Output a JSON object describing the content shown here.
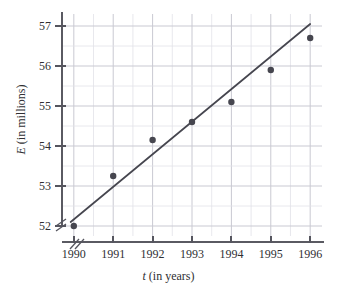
{
  "chart_data": {
    "type": "scatter",
    "title": "",
    "xlabel": "t (in years)",
    "xlabel_variable": "t",
    "xlabel_rest": " (in years)",
    "ylabel": "E (in millions)",
    "ylabel_variable": "E",
    "ylabel_rest": " (in millions)",
    "x": [
      1990,
      1991,
      1992,
      1993,
      1994,
      1995,
      1996
    ],
    "values": [
      52.0,
      53.25,
      54.15,
      54.6,
      55.1,
      55.9,
      56.7
    ],
    "series": [
      {
        "name": "E (in millions)",
        "values": [
          52.0,
          53.25,
          54.15,
          54.6,
          55.1,
          55.9,
          56.7
        ]
      }
    ],
    "xtick_labels": [
      "1990",
      "1991",
      "1992",
      "1993",
      "1994",
      "1995",
      "1996"
    ],
    "ytick_labels": [
      "52",
      "53",
      "54",
      "55",
      "56",
      "57"
    ],
    "ytick_values": [
      52,
      53,
      54,
      55,
      56,
      57
    ],
    "xlim": [
      1989.7,
      1996.3
    ],
    "ylim": [
      51.75,
      57.3
    ],
    "grid": true,
    "minor_grid": true,
    "minor_grid_step_x": 0.5,
    "minor_grid_step_y": 0.5,
    "legend": "none",
    "axis_break": true,
    "axis_break_note": "double slash break on both x and y axes near origin",
    "trend_line": {
      "type": "line",
      "label": "best fit line",
      "x_start": 1989.92,
      "y_start": 52.1,
      "x_end": 1996.0,
      "y_end": 57.05
    },
    "colors": {
      "marker": "#46464f",
      "line": "#46464f",
      "axis": "#55555e",
      "grid": "#c9c9d2",
      "minor_grid": "#e2e2e8",
      "text": "#2f2f33",
      "background": "#ffffff"
    }
  }
}
